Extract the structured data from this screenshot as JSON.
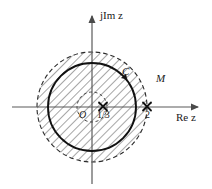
{
  "figure": {
    "type": "complex-plane-diagram",
    "width": 212,
    "height": 189,
    "background_color": "#ffffff",
    "line_color": "#1a1a1a",
    "axis_color": "#555555"
  },
  "axes": {
    "origin": {
      "x": 92,
      "y": 107
    },
    "imaginary": {
      "label": "jIm z",
      "label_parts": {
        "prefix": "jIm",
        "variable": "z"
      },
      "x": 92,
      "arrow_top_y": 14,
      "bottom_y": 184
    },
    "real": {
      "label": "Re z",
      "label_parts": {
        "prefix": "Re",
        "variable": "z"
      },
      "y": 107,
      "left_x": 12,
      "arrow_right_x": 200
    }
  },
  "origin_label": "O",
  "contour": {
    "name": "C",
    "label": "C",
    "style": "solid",
    "center": {
      "x": 92,
      "y": 107
    },
    "radius": 44,
    "direction": "counterclockwise",
    "arrow_angle_deg": 40
  },
  "region": {
    "name": "M",
    "label": "M",
    "style": "dashed",
    "center": {
      "x": 92,
      "y": 107
    },
    "radius": 55,
    "fill": "hatched",
    "hatch_angle_deg": 45,
    "hatch_spacing_px": 6
  },
  "inner_dashed_circle": {
    "center": {
      "x": 92,
      "y": 107
    },
    "radius": 15,
    "style": "dashed"
  },
  "poles": [
    {
      "label": "1/3",
      "marker": "cross-x",
      "value": 0.3333,
      "x": 103,
      "y": 107,
      "label_x": 97,
      "label_y": 110
    },
    {
      "label": "2",
      "marker": "cross-x",
      "value": 2,
      "x": 147,
      "y": 107,
      "label_x": 145,
      "label_y": 110
    }
  ]
}
